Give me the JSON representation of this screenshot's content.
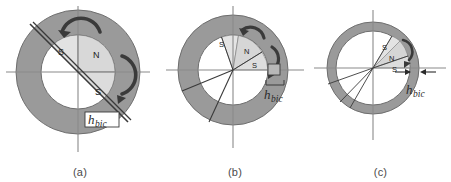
{
  "figure": {
    "background_color": "#ffffff",
    "ring_color": "#9a9a9a",
    "ring_edge_color": "#6e6e6e",
    "sector_light_color": "#dcdcdc",
    "sector_mid_color": "#c9c9c9",
    "inner_bore_color": "#ffffff",
    "axis_color": "#7a7a7a",
    "line_color": "#3a3a3a",
    "arrow_color": "#3a3a3a",
    "panel_count": 3
  },
  "panels": [
    {
      "id": "a",
      "caption": "(a)",
      "hbic_label": "h",
      "hbic_sub": "bic",
      "pole_labels": [
        "S",
        "N",
        "S"
      ],
      "arc_arrows": 2,
      "sector_span_deg": 180,
      "notes_axes": [
        "horizontal",
        "vertical",
        "diagonal"
      ]
    },
    {
      "id": "b",
      "caption": "(b)",
      "hbic_label": "h",
      "hbic_sub": "bic",
      "pole_labels": [
        "S",
        "N",
        "S"
      ],
      "arc_arrows": 2,
      "sector_span_deg": 90,
      "notes_axes": [
        "horizontal",
        "vertical",
        "radial-pair"
      ]
    },
    {
      "id": "c",
      "caption": "(c)",
      "hbic_label": "h",
      "hbic_sub": "bic",
      "pole_labels": [
        "S",
        "N",
        "S"
      ],
      "arc_arrows": 1,
      "sector_span_deg": 40,
      "notes_axes": [
        "horizontal",
        "vertical",
        "radial-pair"
      ]
    }
  ]
}
